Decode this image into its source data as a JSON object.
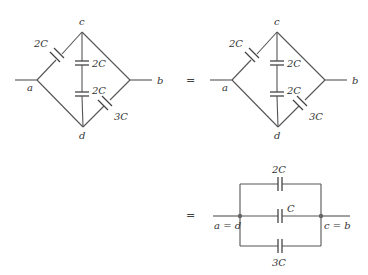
{
  "diagram": {
    "type": "capacitor-bridge-equivalence",
    "left_network": {
      "nodes": {
        "a": "a",
        "b": "b",
        "c": "c",
        "d": "d"
      },
      "capacitors": {
        "ac": "2C",
        "cd_upper": "2C",
        "cd_lower": "2C",
        "db": "3C"
      }
    },
    "right_network": {
      "nodes": {
        "a": "a",
        "b": "b",
        "c": "c",
        "d": "d"
      },
      "capacitors": {
        "ac": "2C",
        "cd_upper": "2C",
        "cd_lower": "2C",
        "db": "3C"
      }
    },
    "equals_1": "=",
    "equals_2": "=",
    "reduced_network": {
      "left_node": "a = d",
      "right_node": "c = b",
      "capacitors": {
        "top": "2C",
        "middle": "C",
        "bottom": "3C"
      }
    }
  }
}
